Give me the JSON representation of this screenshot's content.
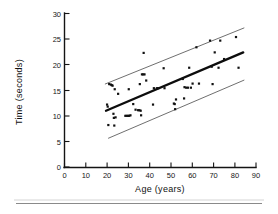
{
  "figure": {
    "background_color": "#ffffff",
    "ink_color": "#111111",
    "band_color": "#4a4a4a",
    "footer_rule_color": "#8a8a8a"
  },
  "chart_data": {
    "type": "scatter",
    "title": "",
    "subtitle": "",
    "xlabel": "Age (years)",
    "ylabel": "Time (seconds)",
    "xlim": [
      0,
      90
    ],
    "ylim": [
      0,
      30
    ],
    "xticks": [
      0,
      10,
      20,
      30,
      40,
      50,
      60,
      70,
      80,
      90
    ],
    "xtick_labels": [
      "0",
      "10",
      "20",
      "30",
      "40",
      "50",
      "60",
      "70",
      "80",
      "90"
    ],
    "yticks": [
      0,
      5,
      10,
      15,
      20,
      25,
      30
    ],
    "ytick_labels": [
      "0",
      "5",
      "10",
      "15",
      "20",
      "25",
      "30"
    ],
    "grid": false,
    "legend": null,
    "legend_position": "none",
    "annotations": [],
    "marker": "square-dot",
    "marker_size_px": 2.2,
    "points": [
      [
        20.0,
        12.2
      ],
      [
        20.3,
        11.8
      ],
      [
        20.6,
        8.2
      ],
      [
        21.0,
        16.2
      ],
      [
        21.8,
        16.1
      ],
      [
        22.2,
        16.0
      ],
      [
        22.6,
        15.9
      ],
      [
        23.0,
        10.4
      ],
      [
        23.2,
        9.6
      ],
      [
        23.4,
        8.1
      ],
      [
        23.6,
        15.2
      ],
      [
        24.0,
        9.7
      ],
      [
        25.2,
        14.3
      ],
      [
        28.6,
        10.0
      ],
      [
        29.2,
        10.0
      ],
      [
        29.8,
        10.0
      ],
      [
        30.4,
        10.0
      ],
      [
        30.2,
        15.2
      ],
      [
        31.0,
        10.1
      ],
      [
        32.3,
        12.3
      ],
      [
        33.4,
        11.2
      ],
      [
        34.6,
        11.1
      ],
      [
        35.2,
        11.1
      ],
      [
        35.8,
        11.0
      ],
      [
        35.4,
        16.2
      ],
      [
        36.0,
        10.1
      ],
      [
        36.4,
        18.1
      ],
      [
        37.0,
        18.1
      ],
      [
        37.6,
        18.1
      ],
      [
        37.2,
        22.3
      ],
      [
        38.4,
        16.9
      ],
      [
        41.6,
        12.2
      ],
      [
        42.0,
        15.4
      ],
      [
        43.4,
        15.4
      ],
      [
        44.0,
        15.4
      ],
      [
        46.6,
        19.3
      ],
      [
        47.0,
        15.4
      ],
      [
        51.4,
        12.4
      ],
      [
        51.8,
        12.3
      ],
      [
        52.0,
        11.3
      ],
      [
        52.4,
        13.2
      ],
      [
        55.6,
        17.2
      ],
      [
        56.2,
        13.4
      ],
      [
        56.4,
        15.6
      ],
      [
        57.2,
        15.5
      ],
      [
        58.0,
        15.5
      ],
      [
        58.6,
        19.4
      ],
      [
        59.4,
        15.5
      ],
      [
        60.2,
        16.3
      ],
      [
        62.0,
        23.4
      ],
      [
        63.2,
        16.3
      ],
      [
        68.4,
        24.7
      ],
      [
        69.2,
        19.6
      ],
      [
        69.6,
        16.2
      ],
      [
        70.6,
        22.4
      ],
      [
        72.4,
        19.4
      ],
      [
        73.2,
        24.7
      ],
      [
        75.0,
        21.1
      ],
      [
        80.6,
        25.4
      ],
      [
        81.8,
        19.4
      ]
    ],
    "series": [
      {
        "name": "regression-line",
        "type": "line",
        "x": [
          19.5,
          84.0
        ],
        "y": [
          11.0,
          22.4
        ]
      },
      {
        "name": "upper-band-line",
        "type": "line",
        "x": [
          19.0,
          84.5
        ],
        "y": [
          16.2,
          27.2
        ]
      },
      {
        "name": "lower-band-line",
        "type": "line",
        "x": [
          20.5,
          84.5
        ],
        "y": [
          5.6,
          17.0
        ]
      }
    ]
  }
}
